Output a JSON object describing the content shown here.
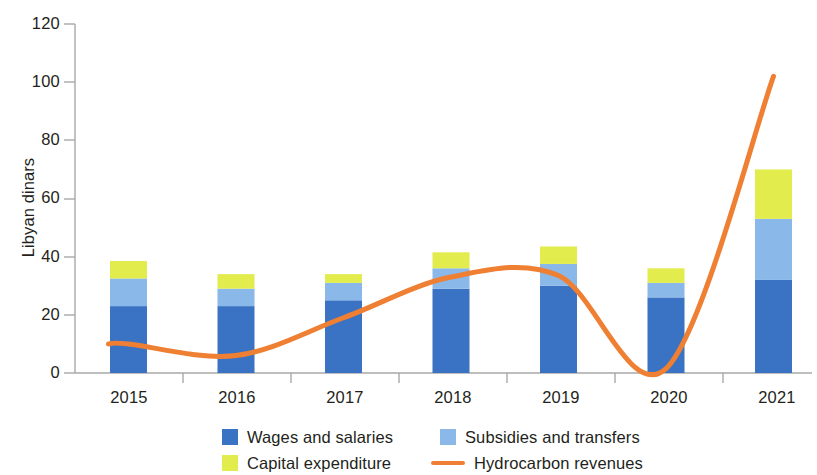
{
  "chart_data": {
    "type": "bar",
    "subtype": "stacked-bar-with-line-overlay",
    "title": "",
    "xlabel": "",
    "ylabel": "Libyan dinars",
    "categories": [
      "2015",
      "2016",
      "2017",
      "2018",
      "2019",
      "2020",
      "2021"
    ],
    "ylim": [
      0,
      120
    ],
    "yticks": [
      0,
      20,
      40,
      60,
      80,
      100,
      120
    ],
    "ytick_labels": [
      "0",
      "20",
      "40",
      "60",
      "80",
      "100",
      "120"
    ],
    "grid": false,
    "legend_position": "bottom",
    "series": [
      {
        "name": "Wages and salaries",
        "type": "bar",
        "stack": "expenditure",
        "color": "#3a72c4",
        "values": [
          23,
          23,
          25,
          29,
          30,
          26,
          32
        ]
      },
      {
        "name": "Subsidies and transfers",
        "type": "bar",
        "stack": "expenditure",
        "color": "#8ab8e8",
        "values": [
          9.5,
          6,
          6,
          7,
          7.5,
          5,
          21
        ]
      },
      {
        "name": "Capital expenditure",
        "type": "bar",
        "stack": "expenditure",
        "color": "#e2ec4d",
        "values": [
          6,
          5,
          3,
          5.5,
          6,
          5,
          17
        ]
      },
      {
        "name": "Hydrocarbon revenues",
        "type": "line",
        "color": "#ef7f32",
        "values": [
          10,
          6,
          19,
          33,
          33.5,
          1.5,
          102
        ]
      }
    ],
    "stack_totals": [
      38.5,
      34,
      34,
      41.5,
      43.5,
      36,
      70
    ]
  },
  "legend": {
    "items": [
      {
        "label": "Wages and salaries",
        "marker": "square-swatch",
        "color": "#3a72c4"
      },
      {
        "label": "Subsidies and transfers",
        "marker": "square-swatch",
        "color": "#8ab8e8"
      },
      {
        "label": "Capital expenditure",
        "marker": "square-swatch",
        "color": "#e2ec4d"
      },
      {
        "label": "Hydrocarbon revenues",
        "marker": "line-swatch",
        "color": "#ef7f32"
      }
    ]
  },
  "axes": {
    "y_title": "Libyan dinars",
    "y_labels": [
      "120",
      "100",
      "80",
      "60",
      "40",
      "20",
      "0"
    ],
    "x_labels": [
      "2015",
      "2016",
      "2017",
      "2018",
      "2019",
      "2020",
      "2021"
    ]
  },
  "colors": {
    "wages": "#3a72c4",
    "subsidies": "#8ab8e8",
    "capital": "#e2ec4d",
    "hydrocarbon": "#ef7f32",
    "axis": "#9b9b9b",
    "text": "#231f20"
  }
}
